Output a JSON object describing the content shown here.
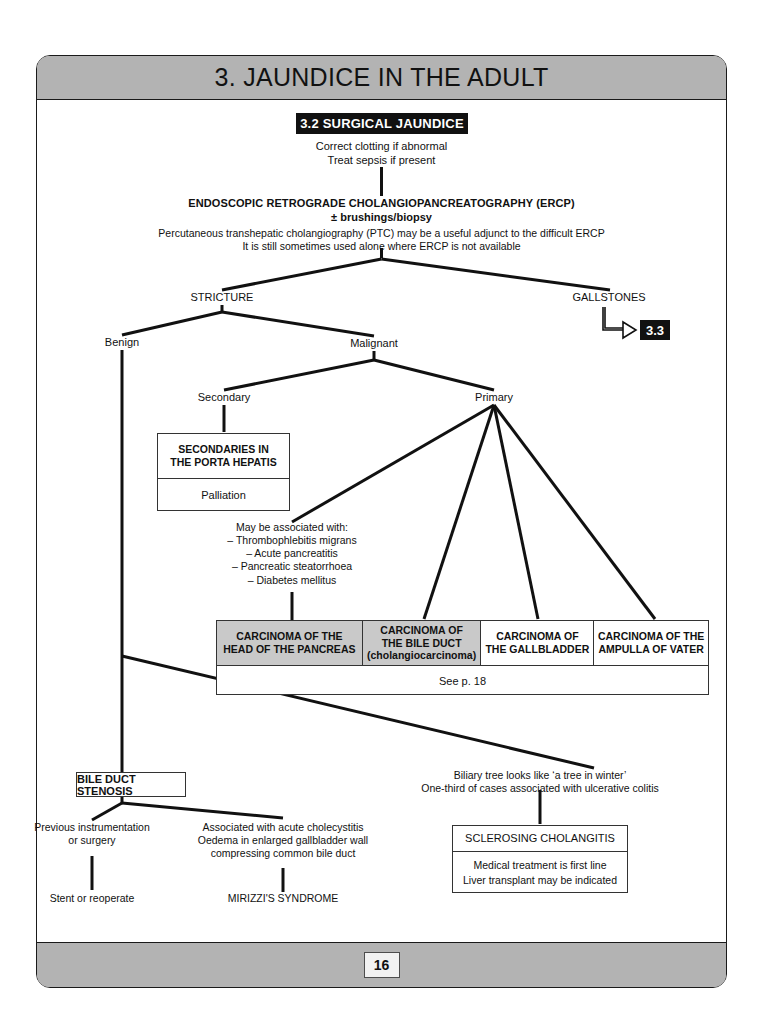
{
  "page": {
    "title": "3. JAUNDICE IN THE ADULT",
    "page_number": "16"
  },
  "section_chip": {
    "label": "3.2 SURGICAL JAUNDICE"
  },
  "nodes": {
    "prep_line1": "Correct clotting if abnormal",
    "prep_line2": "Treat sepsis if present",
    "ercp_title": "ENDOSCOPIC RETROGRADE CHOLANGIOPANCREATOGRAPHY (ERCP)",
    "ercp_sub": "± brushings/biopsy",
    "ercp_note1": "Percutaneous transhepatic cholangiography (PTC) may be a useful adjunct to the difficult ERCP",
    "ercp_note2": "It is still sometimes used alone where ERCP is not available",
    "stricture": "STRICTURE",
    "gallstones": "GALLSTONES",
    "gallstones_ref": "3.3",
    "benign": "Benign",
    "malignant": "Malignant",
    "secondary": "Secondary",
    "primary": "Primary",
    "assoc_heading": "May be associated with:",
    "assoc_item1": "– Thrombophlebitis migrans",
    "assoc_item2": "– Acute pancreatitis",
    "assoc_item3": "– Pancreatic steatorrhoea",
    "assoc_item4": "– Diabetes mellitus",
    "previous_instr_l1": "Previous instrumentation",
    "previous_instr_l2": "or surgery",
    "stent_or_reoperate": "Stent or reoperate",
    "assoc_chole_l1": "Associated with acute cholecystitis",
    "assoc_chole_l2": "Oedema in enlarged gallbladder wall",
    "assoc_chole_l3": "compressing common bile duct",
    "mirizzi": "MIRIZZI'S SYNDROME",
    "biliary_tree_l1": "Biliary tree looks like ‘a tree in winter’",
    "biliary_tree_l2": "One-third of cases associated with ulcerative colitis"
  },
  "boxes": {
    "secondaries": {
      "head_l1": "SECONDARIES IN",
      "head_l2": "THE PORTA HEPATIS",
      "body": "Palliation"
    },
    "bile_duct_stenosis": {
      "label": "BILE DUCT STENOSIS"
    },
    "sclerosing": {
      "head": "SCLEROSING CHOLANGITIS",
      "body_l1": "Medical treatment is first line",
      "body_l2": "Liver transplant may be indicated"
    }
  },
  "carcinoma_table": {
    "columns": [
      {
        "line1": "CARCINOMA OF THE",
        "line2": "HEAD OF THE PANCREAS",
        "line3": "",
        "shaded": true
      },
      {
        "line1": "CARCINOMA OF",
        "line2": "THE BILE DUCT",
        "line3": "(cholangiocarcinoma)",
        "shaded": true
      },
      {
        "line1": "CARCINOMA OF",
        "line2": "THE GALLBLADDER",
        "line3": "",
        "shaded": false
      },
      {
        "line1": "CARCINOMA OF THE",
        "line2": "AMPULLA OF VATER",
        "line3": "",
        "shaded": false
      }
    ],
    "footer": "See p. 18"
  },
  "colors": {
    "bar_grey": "#b3b3b3",
    "chip_black": "#111111",
    "line_black": "#111111",
    "shaded_cell": "#c9c9c9"
  }
}
